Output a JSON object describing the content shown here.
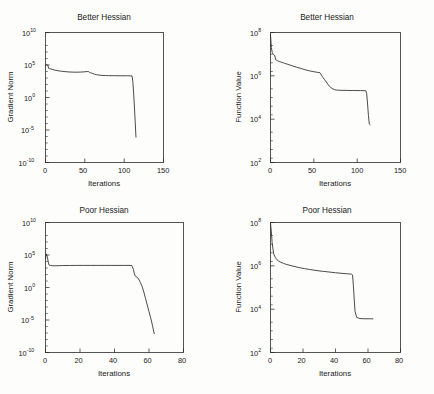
{
  "figure": {
    "background_color": "#fdfdfb",
    "line_color": "#2b2b2b",
    "panel_count": 4
  },
  "chart_data": [
    {
      "id": "top-left",
      "type": "line",
      "title": "Better Hessian",
      "xlabel": "Iterations",
      "ylabel": "Gradient Norm",
      "yscale": "log",
      "xlim": [
        0,
        150
      ],
      "ylim": [
        1e-10,
        10000000000.0
      ],
      "xticks": [
        0,
        50,
        100,
        150
      ],
      "xticklabels": [
        "0",
        "50",
        "100",
        "150"
      ],
      "yticks": [
        1e-10,
        1e-05,
        1,
        100000,
        10000000000
      ],
      "yticklabels": [
        "10^-10",
        "10^-5",
        "10^0",
        "10^5",
        "10^10"
      ],
      "grid": false,
      "legend": null,
      "series": [
        {
          "name": "gradient norm",
          "x": [
            0,
            1,
            2,
            3,
            4,
            5,
            6,
            7,
            9,
            12,
            16,
            20,
            25,
            30,
            35,
            40,
            45,
            50,
            53,
            55,
            56,
            57,
            58,
            60,
            62,
            65,
            68,
            72,
            76,
            80,
            88,
            96,
            104,
            108,
            110,
            111,
            112,
            113,
            114,
            115
          ],
          "y": [
            90000,
            120000,
            100000,
            95000,
            30000,
            28000,
            26000,
            24000,
            20000,
            16000,
            13000,
            11000,
            9500,
            8500,
            8000,
            7800,
            8200,
            9000,
            10000,
            9500,
            7000,
            6500,
            6200,
            5000,
            4000,
            3200,
            2800,
            2500,
            2400,
            2300,
            2250,
            2200,
            2200,
            2150,
            2100,
            300,
            5,
            0.05,
            0.0002,
            8e-07
          ]
        }
      ]
    },
    {
      "id": "top-right",
      "type": "line",
      "title": "Better Hessian",
      "xlabel": "Iterations",
      "ylabel": "Function Value",
      "yscale": "log",
      "xlim": [
        0,
        150
      ],
      "ylim": [
        100,
        100000000
      ],
      "xticks": [
        0,
        50,
        100,
        150
      ],
      "xticklabels": [
        "0",
        "50",
        "100",
        "150"
      ],
      "yticks": [
        100,
        10000,
        1000000,
        100000000
      ],
      "yticklabels": [
        "10^2",
        "10^4",
        "10^6",
        "10^8"
      ],
      "grid": false,
      "legend": null,
      "series": [
        {
          "name": "function value",
          "x": [
            0,
            1,
            2,
            3,
            4,
            5,
            6,
            7,
            8,
            10,
            13,
            16,
            20,
            25,
            30,
            35,
            40,
            45,
            50,
            54,
            57,
            58,
            60,
            62,
            64,
            66,
            68,
            70,
            72,
            74,
            76,
            80,
            88,
            96,
            104,
            108,
            110,
            111,
            112,
            113,
            114,
            115
          ],
          "y": [
            80000000,
            20000000,
            12000000,
            10000000,
            9000000,
            8500000,
            5500000,
            5200000,
            5000000,
            4600000,
            4200000,
            3800000,
            3400000,
            2900000,
            2500000,
            2200000,
            1900000,
            1700000,
            1550000,
            1450000,
            1400000,
            1200000,
            900000,
            700000,
            550000,
            420000,
            330000,
            280000,
            250000,
            230000,
            220000,
            215000,
            212000,
            210000,
            208000,
            207000,
            206000,
            150000,
            50000,
            15000,
            6000,
            5500
          ]
        }
      ]
    },
    {
      "id": "bottom-left",
      "type": "line",
      "title": "Poor Hessian",
      "xlabel": "Iterations",
      "ylabel": "Gradient Norm",
      "yscale": "log",
      "xlim": [
        0,
        80
      ],
      "ylim": [
        1e-10,
        10000000000.0
      ],
      "xticks": [
        0,
        20,
        40,
        60,
        80
      ],
      "xticklabels": [
        "0",
        "20",
        "40",
        "60",
        "80"
      ],
      "yticks": [
        1e-10,
        1e-05,
        1,
        100000,
        10000000000
      ],
      "yticklabels": [
        "10^-10",
        "10^-5",
        "10^0",
        "10^5",
        "10^10"
      ],
      "grid": false,
      "legend": null,
      "series": [
        {
          "name": "gradient norm",
          "x": [
            0,
            0.5,
            1,
            1.5,
            2,
            2.5,
            3,
            4,
            5,
            6,
            8,
            10,
            14,
            18,
            22,
            26,
            30,
            34,
            38,
            42,
            46,
            49,
            50,
            51,
            51.5,
            52,
            53,
            54,
            55,
            56,
            57,
            58,
            59,
            60,
            61,
            62,
            63
          ],
          "y": [
            30000,
            150000,
            60000,
            12000,
            3000,
            2600,
            2400,
            2300,
            2200,
            2200,
            2300,
            2400,
            2450,
            2500,
            2500,
            2500,
            2500,
            2500,
            2500,
            2500,
            2500,
            2500,
            2400,
            600,
            120,
            60,
            40,
            20,
            6,
            1.5,
            0.2,
            0.02,
            0.002,
            0.0002,
            2e-05,
            1.5e-06,
            8e-08
          ]
        }
      ]
    },
    {
      "id": "bottom-right",
      "type": "line",
      "title": "Poor Hessian",
      "xlabel": "Iterations",
      "ylabel": "Function Value",
      "yscale": "log",
      "xlim": [
        0,
        80
      ],
      "ylim": [
        100,
        100000000
      ],
      "xticks": [
        0,
        20,
        40,
        60,
        80
      ],
      "xticklabels": [
        "0",
        "20",
        "40",
        "60",
        "80"
      ],
      "yticks": [
        100,
        10000,
        1000000,
        100000000
      ],
      "yticklabels": [
        "10^2",
        "10^4",
        "10^6",
        "10^8"
      ],
      "grid": false,
      "legend": null,
      "series": [
        {
          "name": "function value",
          "x": [
            0,
            0.5,
            1,
            1.5,
            2,
            3,
            4,
            5,
            6,
            8,
            10,
            12,
            15,
            18,
            21,
            24,
            28,
            32,
            36,
            40,
            44,
            47,
            49,
            50,
            50.5,
            51,
            51.5,
            52,
            53,
            55,
            58,
            60,
            62,
            63
          ],
          "y": [
            90000000,
            40000000,
            12000000,
            6000000,
            3500000,
            2400000,
            1900000,
            1650000,
            1500000,
            1300000,
            1150000,
            1050000,
            920000,
            820000,
            740000,
            680000,
            610000,
            560000,
            520000,
            480000,
            450000,
            430000,
            420000,
            410000,
            380000,
            120000,
            30000,
            8000,
            4200,
            3700,
            3600,
            3600,
            3600,
            3600
          ]
        }
      ]
    }
  ]
}
